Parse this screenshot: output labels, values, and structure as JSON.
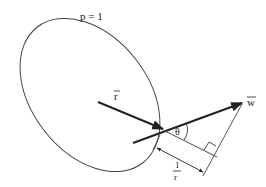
{
  "diagram": {
    "labels": {
      "p_label": "p = 1",
      "r_vector": "r",
      "w_vector": "w",
      "theta": "θ",
      "frac_num": "1",
      "frac_den": "r"
    },
    "colors": {
      "stroke": "#222222",
      "thin_stroke": "#555555",
      "background": "#ffffff"
    }
  }
}
